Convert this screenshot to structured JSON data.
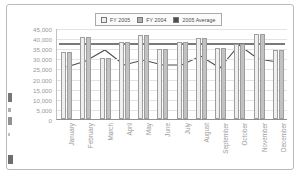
{
  "chart_data": {
    "type": "bar",
    "title": "",
    "xlabel": "",
    "ylabel": "",
    "ylim": [
      0,
      45000
    ],
    "ytick_step": 5000,
    "grid": true,
    "legend_position": "top-center",
    "categories": [
      "January",
      "February",
      "March",
      "April",
      "May",
      "June",
      "July",
      "August",
      "September",
      "October",
      "November",
      "December"
    ],
    "ytick_labels": [
      "45,000",
      "40,000",
      "35,000",
      "30,000",
      "25,000",
      "20,000",
      "15,000",
      "10,000",
      "5,000",
      "0"
    ],
    "ytick_values": [
      45000,
      40000,
      35000,
      30000,
      25000,
      20000,
      15000,
      10000,
      5000,
      0
    ],
    "series": [
      {
        "name": "FY 2005",
        "type": "bar",
        "color": "#efefef",
        "values": [
          33000,
          40500,
          30000,
          38000,
          41500,
          34500,
          38000,
          40000,
          35000,
          37000,
          42000,
          34000
        ]
      },
      {
        "name": "FY 2004",
        "type": "bar",
        "color": "#c2c2c2",
        "values": [
          33000,
          40500,
          30000,
          38000,
          41500,
          34500,
          38000,
          40000,
          35000,
          37000,
          42000,
          34000
        ]
      },
      {
        "name": "2005 Average",
        "type": "line",
        "color": "#4d4d4d",
        "values": [
          26000,
          29000,
          34500,
          27000,
          29500,
          27000,
          27000,
          31500,
          25500,
          37000,
          30000,
          28500
        ]
      }
    ],
    "average_line": {
      "label": "2005 Average",
      "value": 37500,
      "color": "#4d4d4d"
    }
  },
  "legend": {
    "items": [
      {
        "label": "FY 2005",
        "swatch": "#efefef"
      },
      {
        "label": "FY 2004",
        "swatch": "#b0b0b0"
      },
      {
        "label": "2005 Average",
        "swatch": "#4d4d4d"
      }
    ]
  }
}
